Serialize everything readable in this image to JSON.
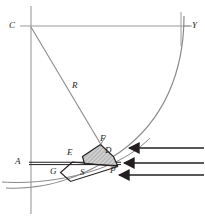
{
  "figure": {
    "background_color": "#ffffff",
    "line_color": "#8a8a8a",
    "dark_line_color": "#231f20",
    "shade_fill_color": "#c9c9c9",
    "width": 205,
    "height": 220
  },
  "labels": {
    "center": "C",
    "axis_y": "Y",
    "radius": "R",
    "point_e": "E",
    "point_f": "F",
    "point_d": "D",
    "point_a": "A",
    "point_g": "G",
    "point_s": "S",
    "point_p": "P"
  },
  "geometry": {
    "center_point": [
      31,
      26
    ],
    "radius_label_point": [
      76,
      86
    ],
    "vertical_axis_x": 31,
    "horizontal_top_y": 26,
    "horizontal_mid_y": 163,
    "arc_big_start": [
      196,
      18
    ],
    "arc_big_end": [
      0,
      190
    ],
    "point_f": [
      101,
      145
    ],
    "point_d": [
      113,
      156
    ],
    "point_e": [
      82,
      155
    ],
    "point_p": [
      118,
      166
    ],
    "point_g": [
      62,
      170
    ]
  },
  "arrows": {
    "count": 3,
    "direction": "left",
    "color": "#231f20",
    "rows": [
      {
        "y": 148,
        "x_start": 205,
        "x_end": 128
      },
      {
        "y": 163,
        "x_start": 205,
        "x_end": 123
      },
      {
        "y": 175,
        "x_start": 205,
        "x_end": 118
      }
    ]
  },
  "tick_marks": {
    "c_dash": "–",
    "y_dash": "–"
  }
}
